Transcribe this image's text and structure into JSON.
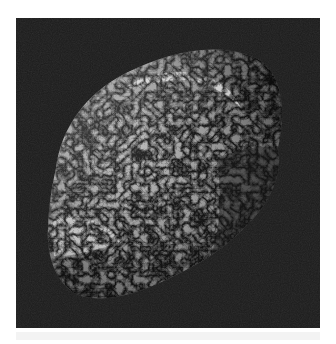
{
  "image": {
    "subject": "Hyperion moon",
    "alt": "Grayscale photograph of Saturn's sponge-textured moon Hyperion against a black background",
    "colors": {
      "page_background": "#ffffff",
      "space_background": "#1b1b1b",
      "surface_light": "#cfcfcf",
      "surface_mid": "#8a8a8a",
      "surface_dark": "#3a3a3a"
    }
  }
}
